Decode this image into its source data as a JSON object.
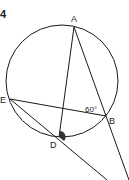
{
  "problem_number": "4",
  "points": {
    "A": {
      "label": "A",
      "x": 74,
      "y": 27
    },
    "B": {
      "label": "B",
      "x": 106,
      "y": 116
    },
    "D": {
      "label": "D",
      "x": 59,
      "y": 137
    },
    "E": {
      "label": "E",
      "x": 10,
      "y": 99
    }
  },
  "circle": {
    "cx": 62,
    "cy": 81,
    "r": 56
  },
  "angle_label": "60°",
  "colors": {
    "stroke": "#1a1a1a",
    "marker": "#333333",
    "background": "#ffffff"
  }
}
